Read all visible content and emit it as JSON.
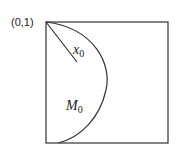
{
  "diagram": {
    "corner_label": "(0,1)",
    "radius_label": {
      "main": "x",
      "sub": "0"
    },
    "region_label": {
      "main": "M",
      "sub": "0"
    },
    "shapes": [
      "unit-square",
      "circular-arc-from-top-left-corner",
      "radius-line"
    ]
  }
}
